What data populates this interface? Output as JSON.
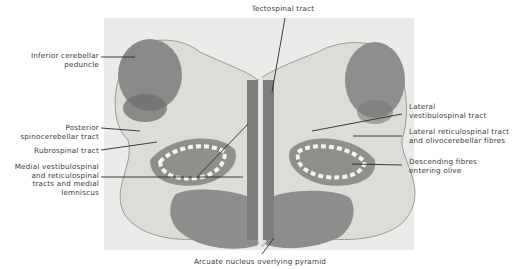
{
  "figure": {
    "labels_left": [
      {
        "id": "inferior-cerebellar-peduncle",
        "lines": [
          "Inferior cerebellar",
          "peduncle"
        ]
      },
      {
        "id": "posterior-spinocerebellar-tract",
        "lines": [
          "Posterior",
          "spinocerebellar tract"
        ]
      },
      {
        "id": "rubrospinal-tract",
        "lines": [
          "Rubrospinal tract"
        ]
      },
      {
        "id": "medial-vestibulospinal",
        "lines": [
          "Medial vestibulospinal",
          "and reticulospinal",
          "tracts and medial",
          "lemniscus"
        ]
      }
    ],
    "labels_right": [
      {
        "id": "lateral-vestibulospinal-tract",
        "lines": [
          "Lateral",
          "vestibulospinal tract"
        ]
      },
      {
        "id": "lateral-reticulospinal-tract",
        "lines": [
          "Lateral reticulospinal tract",
          "and olivocerebellar fibres"
        ]
      },
      {
        "id": "descending-fibres",
        "lines": [
          "Descending fibres",
          "entering olive"
        ]
      }
    ],
    "label_top": {
      "id": "tectospinal-tract",
      "lines": [
        "Tectospinal tract"
      ]
    },
    "label_bottom": {
      "id": "arcuate-nucleus",
      "lines": [
        "Arcuate nucleus overlying pyramid"
      ]
    },
    "colors": {
      "background": "#ffffff",
      "panel": "#e9e9e7",
      "tissue_light": "#d6d6d3",
      "tissue_mid": "#a9a9a6",
      "tissue_dark": "#7a7a78",
      "olive_white": "#f4f4f2",
      "leader": "#2a2a2a",
      "text": "#3a3a3a"
    }
  }
}
